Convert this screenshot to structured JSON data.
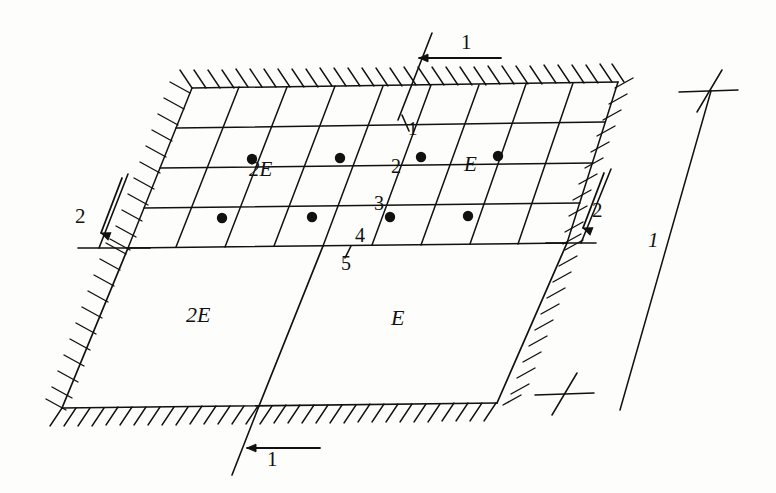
{
  "figure": {
    "type": "engineering-diagram",
    "ink_color": "#111111",
    "background_color": "#fdfdfc"
  },
  "regions": {
    "mesh_left_label": "2E",
    "mesh_mid_label": "2",
    "mesh_right_label": "E",
    "plain_left_label": "2E",
    "plain_right_label": "E"
  },
  "node_numbers": {
    "n1": "1",
    "n2": "2",
    "n3": "3",
    "n4": "4",
    "n5": "5"
  },
  "section_marks": {
    "top_label": "1",
    "bottom_label": "1",
    "left_label": "2",
    "right_label": "2"
  },
  "dimension": {
    "label": "1"
  },
  "mesh": {
    "rows": 4,
    "columns": 9,
    "node_dot_rows": 2,
    "node_dots_per_row": 4
  },
  "geometry": {
    "top_left": [
      192,
      88
    ],
    "top_right": [
      618,
      82
    ],
    "mid_left": [
      128,
      248
    ],
    "mid_right": [
      567,
      243
    ],
    "bottom_left": [
      62,
      408
    ],
    "bottom_right": [
      497,
      403
    ]
  }
}
